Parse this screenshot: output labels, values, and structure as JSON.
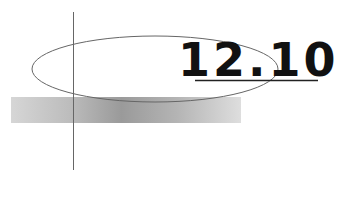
{
  "section_number": "12.10",
  "colors": {
    "text": "#111111",
    "line": "#555555",
    "bar_dark": "#9a9a9a",
    "bar_light": "#dedede"
  }
}
